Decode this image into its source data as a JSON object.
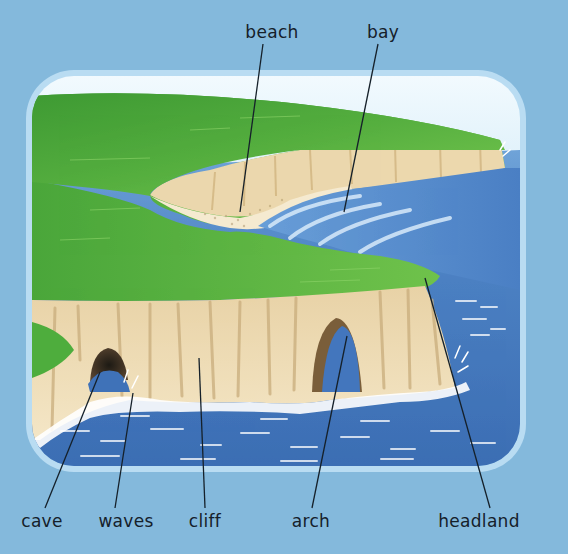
{
  "diagram": {
    "colors": {
      "background": "#84b9dc",
      "frame_border": "#b8dcf2",
      "sky_top": "#eef8fd",
      "sky_bottom": "#a9d3ee",
      "sea_deep": "#3f72b8",
      "sea_mid": "#4f86c6",
      "sea_light": "#6a9fd6",
      "foam": "#ffffff",
      "grass_dark": "#3f9a35",
      "grass_light": "#6cc04a",
      "cliff_light": "#f1dfb8",
      "cliff_mid": "#dcc191",
      "cliff_dark": "#b99a63",
      "cave_dark": "#2a2418",
      "leader_line": "#15202a",
      "label_text": "#15202a"
    },
    "labels": [
      {
        "id": "beach",
        "text": "beach",
        "x": 272,
        "y": 24,
        "line": [
          263,
          44,
          240,
          212
        ]
      },
      {
        "id": "bay",
        "text": "bay",
        "x": 383,
        "y": 24,
        "line": [
          378,
          44,
          344,
          212
        ]
      },
      {
        "id": "cave",
        "text": "cave",
        "x": 42,
        "y": 512,
        "line": [
          45,
          508,
          100,
          372
        ]
      },
      {
        "id": "waves",
        "text": "waves",
        "x": 126,
        "y": 512,
        "line": [
          115,
          508,
          133,
          393
        ]
      },
      {
        "id": "cliff",
        "text": "cliff",
        "x": 205,
        "y": 512,
        "line": [
          205,
          508,
          199,
          358
        ]
      },
      {
        "id": "arch",
        "text": "arch",
        "x": 311,
        "y": 512,
        "line": [
          312,
          508,
          347,
          336
        ]
      },
      {
        "id": "headland",
        "text": "headland",
        "x": 479,
        "y": 512,
        "line": [
          490,
          508,
          425,
          278
        ]
      }
    ]
  }
}
